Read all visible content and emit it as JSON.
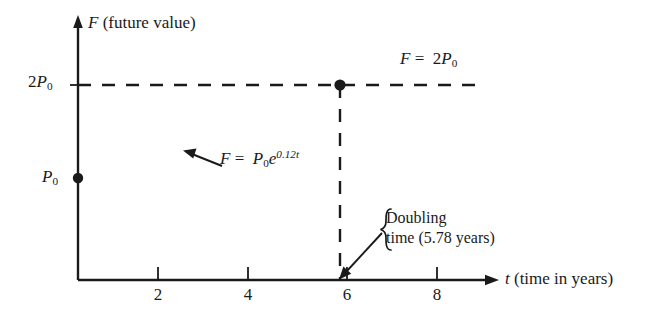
{
  "figure": {
    "type": "math-graph",
    "axes": {
      "y": {
        "label": "F (future value)",
        "symbol": "F",
        "name": "(future value)"
      },
      "x": {
        "label": "t (time in years)",
        "symbol": "t",
        "name": "(time in years)"
      }
    },
    "y_ticks": [
      {
        "id": "p0",
        "label": "P0",
        "base": "P",
        "sub": "0",
        "prefix": ""
      },
      {
        "id": "2p0",
        "label": "2P0",
        "base": "P",
        "sub": "0",
        "prefix": "2"
      }
    ],
    "x_ticks": [
      {
        "value": "2"
      },
      {
        "value": "4"
      },
      {
        "value": "6"
      },
      {
        "value": "8"
      }
    ],
    "equations": {
      "asymptote": {
        "lhs": "F",
        "op": "=",
        "coefficient": "2",
        "base": "P",
        "sub": "0"
      },
      "curve": {
        "lhs": "F",
        "op": "=",
        "base": "P",
        "sub": "0",
        "exp_base": "e",
        "exponent": "0.12t"
      }
    },
    "annotation": {
      "line1": "Doubling",
      "line2": "time (5.78 years)",
      "value": "5.78",
      "unit": "years"
    },
    "points": [
      {
        "name": "initial-principal",
        "x": "0",
        "y": "P0"
      },
      {
        "name": "doubling-point",
        "x": "5.78",
        "y": "2P0"
      }
    ],
    "colors": {
      "ink": "#1a1a1a",
      "background": "#ffffff"
    }
  }
}
